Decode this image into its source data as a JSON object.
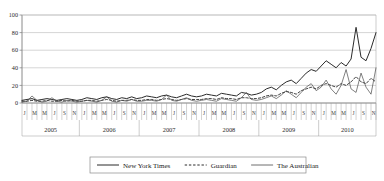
{
  "chart_data": {
    "type": "line",
    "title": "",
    "xlabel": "",
    "ylabel": "",
    "ylim": [
      0,
      100
    ],
    "yticks": [
      0,
      20,
      40,
      60,
      80,
      100
    ],
    "grid": true,
    "legend_position": "bottom",
    "years": [
      "2005",
      "2006",
      "2007",
      "2008",
      "2009",
      "2010"
    ],
    "month_tick_labels": [
      "J",
      "M",
      "M",
      "J",
      "S",
      "N"
    ],
    "x_tick_interval_months": 1,
    "x_label_interval_months": 2,
    "x": [
      "2005-01",
      "2005-02",
      "2005-03",
      "2005-04",
      "2005-05",
      "2005-06",
      "2005-07",
      "2005-08",
      "2005-09",
      "2005-10",
      "2005-11",
      "2005-12",
      "2006-01",
      "2006-02",
      "2006-03",
      "2006-04",
      "2006-05",
      "2006-06",
      "2006-07",
      "2006-08",
      "2006-09",
      "2006-10",
      "2006-11",
      "2006-12",
      "2007-01",
      "2007-02",
      "2007-03",
      "2007-04",
      "2007-05",
      "2007-06",
      "2007-07",
      "2007-08",
      "2007-09",
      "2007-10",
      "2007-11",
      "2007-12",
      "2008-01",
      "2008-02",
      "2008-03",
      "2008-04",
      "2008-05",
      "2008-06",
      "2008-07",
      "2008-08",
      "2008-09",
      "2008-10",
      "2008-11",
      "2008-12",
      "2009-01",
      "2009-02",
      "2009-03",
      "2009-04",
      "2009-05",
      "2009-06",
      "2009-07",
      "2009-08",
      "2009-09",
      "2009-10",
      "2009-11",
      "2009-12",
      "2010-01",
      "2010-02",
      "2010-03",
      "2010-04",
      "2010-05",
      "2010-06",
      "2010-07",
      "2010-08",
      "2010-09",
      "2010-10",
      "2010-11",
      "2010-12"
    ],
    "series": [
      {
        "name": "New York Times",
        "style": "solid",
        "color": "#2b2b2b",
        "width": 1.0,
        "values": [
          3,
          4,
          5,
          3,
          4,
          5,
          4,
          3,
          4,
          5,
          4,
          3,
          4,
          6,
          5,
          4,
          6,
          7,
          5,
          4,
          6,
          5,
          7,
          5,
          6,
          8,
          7,
          6,
          8,
          9,
          7,
          6,
          8,
          10,
          8,
          7,
          8,
          10,
          9,
          8,
          11,
          10,
          9,
          8,
          12,
          11,
          9,
          10,
          12,
          16,
          18,
          15,
          20,
          24,
          26,
          22,
          28,
          34,
          38,
          36,
          42,
          48,
          44,
          40,
          46,
          42,
          50,
          86,
          52,
          48,
          62,
          80
        ]
      },
      {
        "name": "Guardian",
        "style": "dashed",
        "color": "#2b2b2b",
        "width": 0.9,
        "values": [
          2,
          2,
          3,
          2,
          2,
          3,
          2,
          2,
          3,
          2,
          3,
          2,
          2,
          3,
          3,
          2,
          3,
          4,
          3,
          2,
          3,
          3,
          4,
          3,
          3,
          4,
          4,
          3,
          4,
          5,
          4,
          3,
          4,
          5,
          4,
          4,
          4,
          5,
          5,
          4,
          6,
          5,
          5,
          4,
          6,
          6,
          5,
          5,
          6,
          8,
          9,
          8,
          11,
          13,
          12,
          10,
          14,
          16,
          18,
          16,
          20,
          22,
          20,
          18,
          22,
          20,
          24,
          30,
          24,
          22,
          28,
          24
        ]
      },
      {
        "name": "The Australian",
        "style": "solid",
        "color": "#4a4a4a",
        "width": 0.7,
        "values": [
          1,
          2,
          8,
          3,
          1,
          2,
          6,
          2,
          1,
          3,
          2,
          1,
          2,
          3,
          2,
          1,
          3,
          7,
          2,
          1,
          3,
          2,
          4,
          2,
          2,
          3,
          3,
          2,
          4,
          9,
          3,
          2,
          4,
          6,
          3,
          2,
          3,
          4,
          3,
          2,
          5,
          4,
          3,
          2,
          6,
          12,
          4,
          3,
          4,
          6,
          8,
          5,
          9,
          14,
          10,
          6,
          12,
          18,
          22,
          14,
          18,
          26,
          16,
          10,
          20,
          38,
          16,
          12,
          34,
          18,
          10,
          40
        ]
      }
    ],
    "legend": [
      {
        "label": "New York Times",
        "style": "solid"
      },
      {
        "label": "Guardian",
        "style": "dashed"
      },
      {
        "label": "The Australian",
        "style": "solid"
      }
    ]
  }
}
